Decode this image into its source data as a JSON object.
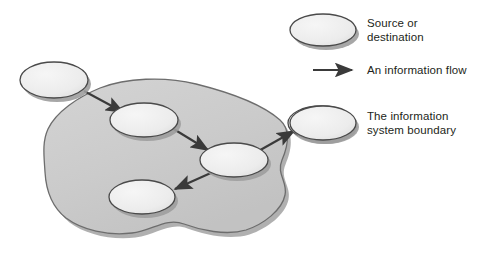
{
  "figure": {
    "type": "context-diagram"
  },
  "colors": {
    "boundary_fill": "#cdcdcd",
    "boundary_stroke": "#6f6f6f",
    "ellipse_fill": "#eeeeee",
    "ellipse_stroke": "#4a4a4a",
    "shadow": "#9a9a9a",
    "arrow": "#3a3a3a",
    "text": "#231f20",
    "page_background": "#ffffff"
  },
  "legend": {
    "items": [
      {
        "key": "source",
        "symbol": "ellipse-shape",
        "label": "Source or\ndestination"
      },
      {
        "key": "flow",
        "symbol": "arrow-right-icon",
        "label": "An information flow"
      },
      {
        "key": "boundary",
        "symbol": "ellipse-shape",
        "label": "The information\nsystem boundary"
      }
    ]
  },
  "diagram": {
    "boundary": {
      "name": "information-system-boundary",
      "path": "M 100 88 C 126 78 164 76 196 84 C 228 92 262 104 280 120 C 291 130 288 146 282 160 C 276 174 288 182 285 195 C 282 210 264 224 246 230 C 226 236 200 230 184 224 C 166 217 152 231 132 233 C 108 236 82 230 66 218 C 52 207 46 190 45 172 C 44 156 42 142 48 129 C 56 112 78 97 100 88 Z",
      "shadow_offset": {
        "x": 3,
        "y": 4
      }
    },
    "nodes": [
      {
        "id": "external-source",
        "name": "external-source-ellipse",
        "cx": 54,
        "cy": 80,
        "rx": 34,
        "ry": 18,
        "inside_boundary": false
      },
      {
        "id": "process-1",
        "name": "internal-ellipse-top",
        "cx": 144,
        "cy": 120,
        "rx": 34,
        "ry": 17,
        "inside_boundary": true
      },
      {
        "id": "process-2",
        "name": "internal-ellipse-right",
        "cx": 234,
        "cy": 160,
        "rx": 34,
        "ry": 17,
        "inside_boundary": true
      },
      {
        "id": "process-3",
        "name": "internal-ellipse-bottom",
        "cx": 142,
        "cy": 197,
        "rx": 33,
        "ry": 17,
        "inside_boundary": true
      },
      {
        "id": "external-destination",
        "name": "external-destination-ellipse",
        "cx": 321,
        "cy": 123,
        "rx": 33,
        "ry": 17,
        "inside_boundary": false
      }
    ],
    "flows": [
      {
        "id": "flow-in",
        "name": "flow-arrow-source-to-process1",
        "from": "external-source",
        "to": "process-1",
        "x1": 84,
        "y1": 91,
        "x2": 123,
        "y2": 112
      },
      {
        "id": "flow-1-2",
        "name": "flow-arrow-process1-to-process2",
        "from": "process-1",
        "to": "process-2",
        "x1": 172,
        "y1": 128,
        "x2": 208,
        "y2": 150
      },
      {
        "id": "flow-2-3",
        "name": "flow-arrow-process2-to-process3",
        "from": "process-2",
        "to": "process-3",
        "x1": 213,
        "y1": 172,
        "x2": 175,
        "y2": 189
      },
      {
        "id": "flow-out",
        "name": "flow-arrow-process2-to-destination",
        "from": "process-2",
        "to": "external-destination",
        "x1": 255,
        "y1": 153,
        "x2": 294,
        "y2": 131
      }
    ]
  },
  "legend_symbols": {
    "source_ellipse": {
      "cx": 323,
      "cy": 30,
      "rx": 33,
      "ry": 16
    },
    "boundary_ellipse": {
      "cx": 323,
      "cy": 123,
      "rx": 33,
      "ry": 17
    },
    "flow_arrow": {
      "x1": 313,
      "y1": 70,
      "x2": 352,
      "y2": 70
    }
  }
}
